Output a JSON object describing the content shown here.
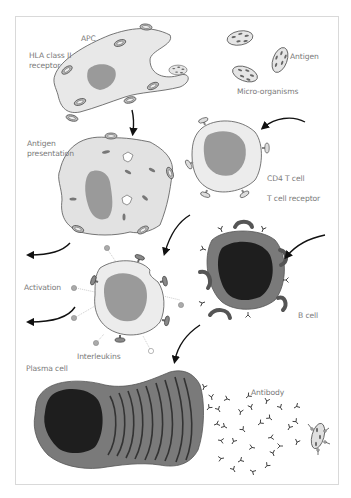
{
  "diagram": {
    "type": "immune-response-illustration",
    "labels": {
      "apc": "APC",
      "hla_receptor": "HLA class II\nreceptor",
      "antigen": "Antigen",
      "micro_organisms": "Micro-organisms",
      "antigen_presentation": "Antigen\npresentation",
      "cd4_t_cell": "CD4 T cell",
      "t_cell_receptor": "T cell receptor",
      "activation": "Activation",
      "interleukins": "Interleukins",
      "b_cell": "B cell",
      "plasma_cell": "Plasma cell",
      "antibody": "Antibody"
    },
    "colors": {
      "cell_light": "#e6e6e6",
      "nucleus_mid": "#9a9a9a",
      "b_cell_body": "#7a7a7a",
      "b_cell_nucleus": "#1e1e1e",
      "outline": "#555555",
      "arrow": "#111111",
      "label_text": "#7a7a7a",
      "frame": "#d9d9d9"
    }
  }
}
